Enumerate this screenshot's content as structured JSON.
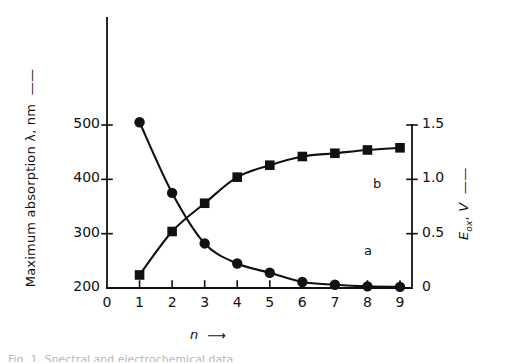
{
  "figure": {
    "background_color": "#ffffff",
    "ink_color": "#111111",
    "caption_remnant": "Fig. 1. Spectral and electrochemical data"
  },
  "chart_data": {
    "type": "line",
    "title": "",
    "xlabel": "n",
    "x": [
      1,
      2,
      3,
      4,
      5,
      6,
      7,
      8,
      9
    ],
    "xlim": [
      0,
      9
    ],
    "xticks": [
      "0",
      "1",
      "2",
      "3",
      "4",
      "5",
      "6",
      "7",
      "8",
      "9"
    ],
    "grid": false,
    "legend_position": "inline-annotations",
    "axes": [
      {
        "id": "left",
        "label": "Maximum absorption λ, nm",
        "unit": "nm",
        "ticks": [
          "200",
          "300",
          "400",
          "500"
        ],
        "tickvalues": [
          200,
          300,
          400,
          500
        ],
        "ylim": [
          200,
          560
        ],
        "arrow": true
      },
      {
        "id": "right",
        "label": "E_ox, V",
        "label_base": "E",
        "label_sub": "ox",
        "label_unit": "V",
        "ticks": [
          "0",
          "0.5",
          "1.0",
          "1.5"
        ],
        "tickvalues": [
          0,
          0.5,
          1.0,
          1.5
        ],
        "ylim": [
          0,
          1.5
        ],
        "arrow": true
      }
    ],
    "series": [
      {
        "name": "a",
        "annotation": "a",
        "axis": "left",
        "marker": "circle",
        "values": [
          505,
          375,
          282,
          245,
          228,
          211,
          206,
          203,
          202
        ]
      },
      {
        "name": "b",
        "annotation": "b",
        "axis": "right",
        "marker": "square",
        "values": [
          0.12,
          0.52,
          0.78,
          1.02,
          1.13,
          1.21,
          1.24,
          1.27,
          1.29
        ]
      }
    ]
  }
}
